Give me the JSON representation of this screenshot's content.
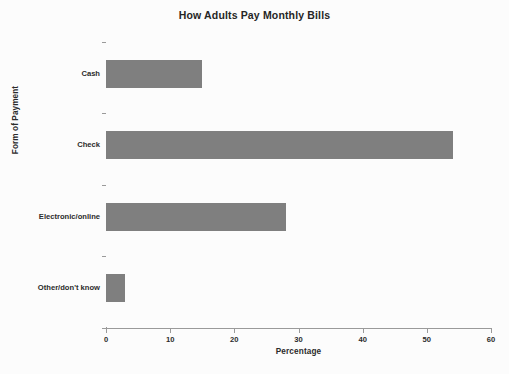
{
  "chart_data": {
    "type": "bar",
    "orientation": "horizontal",
    "title": "How Adults Pay Monthly Bills",
    "xlabel": "Percentage",
    "ylabel": "Form of Payment",
    "categories": [
      "Cash",
      "Check",
      "Electronic/online",
      "Other/don't know"
    ],
    "values": [
      15,
      54,
      28,
      3
    ],
    "series": [
      {
        "name": "Percentage",
        "values": [
          15,
          54,
          28,
          3
        ]
      }
    ],
    "xlim": [
      0,
      60
    ],
    "xticks": [
      0,
      10,
      20,
      30,
      40,
      50,
      60
    ],
    "xtick_labels": [
      "0",
      "10",
      "20",
      "30",
      "40",
      "50",
      "60"
    ],
    "grid": false,
    "legend": false,
    "legend_position": "none",
    "bar_color": "#7f7f7f",
    "axis_color": "#9a9a9a",
    "background_color": "#fcfcfc",
    "text_color": "#2b2b2b"
  }
}
